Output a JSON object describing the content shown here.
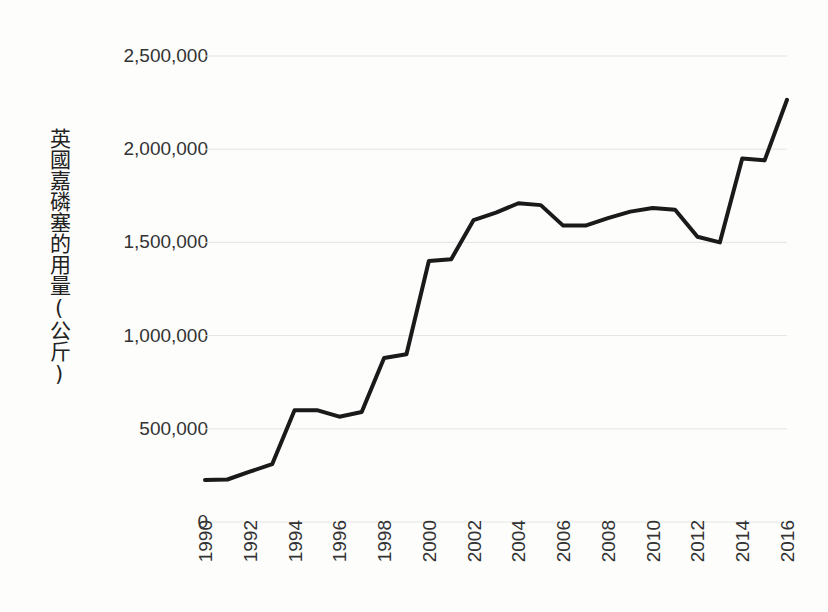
{
  "chart_data": {
    "type": "line",
    "title": "",
    "subtitle": "",
    "xlabel": "",
    "ylabel": "英國嘉磷塞的用量(公斤)",
    "ylabel_chars": [
      "英",
      "國",
      "嘉",
      "磷",
      "塞",
      "的",
      "用",
      "量",
      "(",
      "公",
      "斤",
      ")"
    ],
    "grid": true,
    "grid_axis": "y",
    "legend": false,
    "legend_position": "none",
    "line_color": "#1a1a1a",
    "line_width": 4,
    "grid_color": "#e4e4e2",
    "background_color": "#fdfdfc",
    "text_color": "#333333",
    "xlim": [
      1990,
      2016
    ],
    "ylim": [
      0,
      2500000
    ],
    "y_ticks": [
      0,
      500000,
      1000000,
      1500000,
      2000000,
      2500000
    ],
    "y_tick_labels": [
      "0",
      "500,000",
      "1,000,000",
      "1,500,000",
      "2,000,000",
      "2,500,000"
    ],
    "x_ticks": [
      1990,
      1992,
      1994,
      1996,
      1998,
      2000,
      2002,
      2004,
      2006,
      2008,
      2010,
      2012,
      2014,
      2016
    ],
    "x_tick_labels": [
      "1990",
      "1992",
      "1994",
      "1996",
      "1998",
      "2000",
      "2002",
      "2004",
      "2006",
      "2008",
      "2010",
      "2012",
      "2014",
      "2016"
    ],
    "x": [
      1990,
      1991,
      1992,
      1993,
      1994,
      1995,
      1996,
      1997,
      1998,
      1999,
      2000,
      2001,
      2002,
      2003,
      2004,
      2005,
      2006,
      2007,
      2008,
      2009,
      2010,
      2011,
      2012,
      2013,
      2014,
      2015,
      2016
    ],
    "values": [
      225000,
      228000,
      270000,
      310000,
      600000,
      600000,
      565000,
      590000,
      880000,
      900000,
      1400000,
      1410000,
      1620000,
      1660000,
      1710000,
      1700000,
      1590000,
      1590000,
      1630000,
      1665000,
      1685000,
      1675000,
      1530000,
      1500000,
      1950000,
      1940000,
      2265000
    ],
    "series": [
      {
        "name": "英國嘉磷塞的用量(公斤)",
        "values": [
          225000,
          228000,
          270000,
          310000,
          600000,
          600000,
          565000,
          590000,
          880000,
          900000,
          1400000,
          1410000,
          1620000,
          1660000,
          1710000,
          1700000,
          1590000,
          1590000,
          1630000,
          1665000,
          1685000,
          1675000,
          1530000,
          1500000,
          1950000,
          1940000,
          2265000
        ]
      }
    ]
  }
}
